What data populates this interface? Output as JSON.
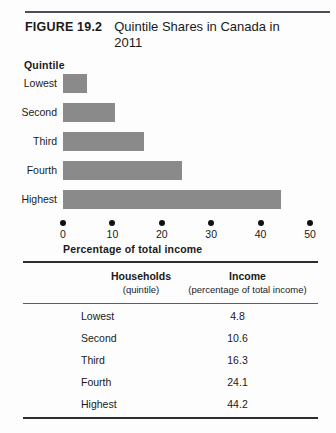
{
  "figure": {
    "number_label": "FIGURE 19.2",
    "title": "Quintile Shares in Canada in 2011"
  },
  "chart_data": {
    "type": "bar",
    "orientation": "horizontal",
    "title": "Quintile Shares in Canada in 2011",
    "categories": [
      "Lowest",
      "Second",
      "Third",
      "Fourth",
      "Highest"
    ],
    "values": [
      4.8,
      10.6,
      16.3,
      24.1,
      44.2
    ],
    "xlabel": "Percentage of total income",
    "ylabel": "Quintile",
    "xlim": [
      0,
      50
    ],
    "xticks": [
      "0",
      "10",
      "20",
      "30",
      "40",
      "50"
    ],
    "xtick_values": [
      0,
      10,
      20,
      30,
      40,
      50
    ],
    "grid": false,
    "legend": "none",
    "bar_color": "#8a8a8a",
    "tick_marker_style": "dot",
    "tick_marker_color": "#111111"
  },
  "table": {
    "columns": [
      {
        "main": "Households",
        "sub": "(quintile)"
      },
      {
        "main": "Income",
        "sub": "(percentage of total income)"
      }
    ],
    "rows": [
      {
        "label": "Lowest",
        "value": "4.8"
      },
      {
        "label": "Second",
        "value": "10.6"
      },
      {
        "label": "Third",
        "value": "16.3"
      },
      {
        "label": "Fourth",
        "value": "24.1"
      },
      {
        "label": "Highest",
        "value": "44.2"
      }
    ]
  }
}
